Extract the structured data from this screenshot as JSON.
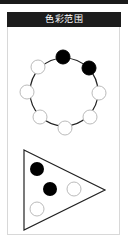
{
  "header": {
    "title": "色彩范围"
  },
  "colors": {
    "header_bg": "#1c1c1c",
    "header_text": "#ffffff",
    "filled": "#000000",
    "empty_stroke": "#bbbbbb",
    "line": "#222222",
    "panel_border": "#d8d8d8"
  },
  "ring": {
    "center": [
      64,
      92
    ],
    "radius": 34,
    "dots": [
      {
        "position": "top",
        "filled": true
      },
      {
        "position": "upper-right",
        "filled": true
      },
      {
        "position": "right",
        "filled": false
      },
      {
        "position": "lower-right",
        "filled": false
      },
      {
        "position": "bottom",
        "filled": false
      },
      {
        "position": "lower-left",
        "filled": false
      },
      {
        "position": "left",
        "filled": false
      },
      {
        "position": "upper-left",
        "filled": false
      }
    ]
  },
  "triangle": {
    "vertices": [
      [
        24,
        150
      ],
      [
        105,
        190
      ],
      [
        24,
        230
      ]
    ],
    "dots": [
      {
        "position": "top-left",
        "filled": true
      },
      {
        "position": "center",
        "filled": true
      },
      {
        "position": "right",
        "filled": false
      },
      {
        "position": "bottom-left",
        "filled": false
      }
    ]
  }
}
